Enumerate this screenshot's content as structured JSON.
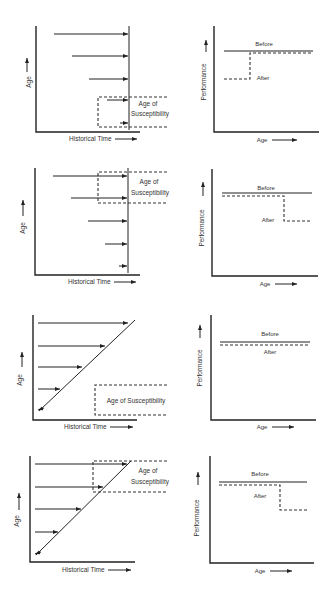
{
  "figure": {
    "rows": [
      {
        "id": "row1",
        "left": {
          "xlabel": "Historical Time",
          "ylabel": "Age",
          "box_label_line1": "Age of",
          "box_label_line2": "Susceptibility"
        },
        "right": {
          "xlabel": "Age",
          "ylabel": "Performance",
          "before_label": "Before",
          "after_label": "After"
        }
      },
      {
        "id": "row2",
        "left": {
          "xlabel": "Historical Time",
          "ylabel": "Age",
          "box_label_line1": "Age of",
          "box_label_line2": "Susceptibility"
        },
        "right": {
          "xlabel": "Age",
          "ylabel": "Performance",
          "before_label": "Before",
          "after_label": "After"
        }
      },
      {
        "id": "row3",
        "left": {
          "xlabel": "Historical Time",
          "ylabel": "Age",
          "box_label": "Age of Susceptibility"
        },
        "right": {
          "xlabel": "Age",
          "ylabel": "Performance",
          "before_label": "Before",
          "after_label": "After"
        }
      },
      {
        "id": "row4",
        "left": {
          "xlabel": "Historical Time",
          "ylabel": "Age",
          "box_label_line1": "Age of",
          "box_label_line2": "Susceptibility"
        },
        "right": {
          "xlabel": "Age",
          "ylabel": "Performance",
          "before_label": "Before",
          "after_label": "After"
        }
      }
    ],
    "arrow_glyph": "——▸",
    "colors": {
      "ink": "#222222",
      "background": "#ffffff"
    }
  }
}
